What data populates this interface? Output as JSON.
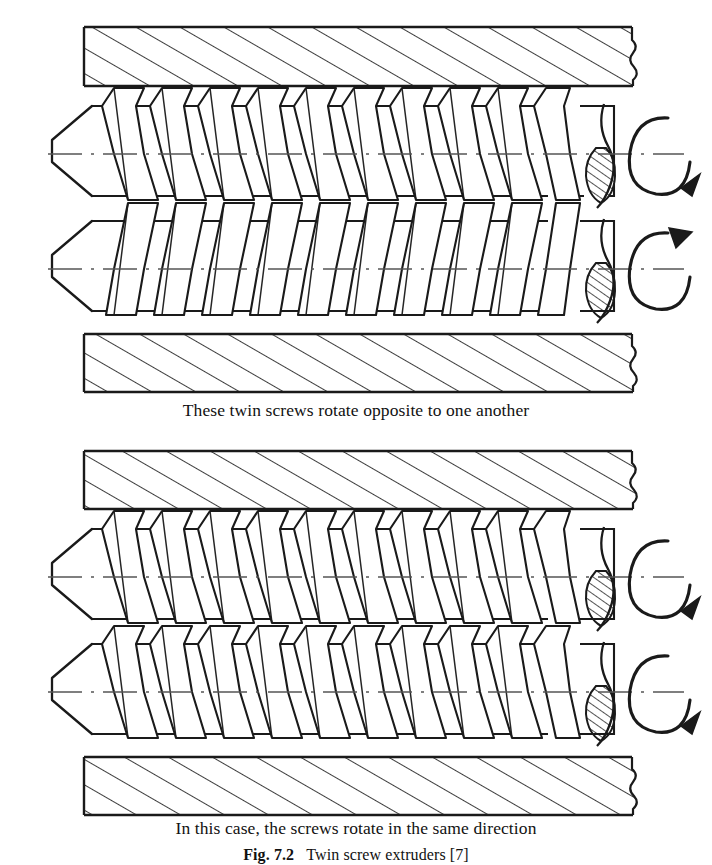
{
  "figure": {
    "caption_top": "These twin screws rotate opposite to one another",
    "caption_bottom": "In this case, the screws rotate in the same direction",
    "figure_number": "Fig. 7.2",
    "figure_title": "Twin screw extruders [7]"
  },
  "diagrams": [
    {
      "id": "counter-rotating",
      "label": "These twin screws rotate opposite to one another",
      "screws": [
        {
          "id": "top-screw-upper",
          "flight_lean": "right",
          "rotation": "clockwise",
          "arrow_position": "bottom-right"
        },
        {
          "id": "top-screw-lower",
          "flight_lean": "left",
          "rotation": "counter-clockwise",
          "arrow_position": "top-right"
        }
      ]
    },
    {
      "id": "co-rotating",
      "label": "In this case, the screws rotate in the same direction",
      "screws": [
        {
          "id": "bottom-screw-upper",
          "flight_lean": "right",
          "rotation": "clockwise",
          "arrow_position": "bottom-right"
        },
        {
          "id": "bottom-screw-lower",
          "flight_lean": "right",
          "rotation": "clockwise",
          "arrow_position": "bottom-right"
        }
      ]
    }
  ],
  "geometry": {
    "flight_count": 10,
    "barrel_wall_hatch_angle_deg": 60,
    "line_color": "#1a1a1a",
    "centerline_color": "#555555",
    "background": "#ffffff"
  },
  "parts": {
    "barrel_wall": "barrel wall (section hatched)",
    "screw_tip": "conical screw tip",
    "screw_flight": "helical screw flight",
    "centerline": "screw axis centerline",
    "break_line": "wavy break line",
    "shaft_section": "hatched shaft cross-section",
    "rotation_arrow": "rotation direction arrow"
  }
}
